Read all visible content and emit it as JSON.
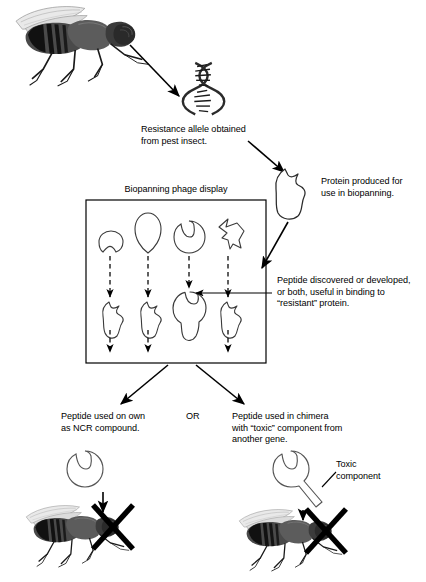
{
  "figure": {
    "title_visible": false,
    "type": "biological-process-flow-diagram",
    "ink_color": "#000000",
    "background": "#ffffff"
  },
  "labels": {
    "resistance_allele": "Resistance allele obtained\nfrom pest insect.",
    "protein_produced": "Protein produced for\nuse in biopanning.",
    "biopanning_box_title": "Biopanning phage display",
    "peptide_discovered": "Peptide discovered or developed,\nor both, useful in binding to\n“resistant” protein.",
    "peptide_on_own": "Peptide used on own\nas NCR compound.",
    "or_connector": "OR",
    "peptide_chimera": "Peptide used in chimera\nwith “toxic” component from\nanother gene.",
    "toxic_component": "Toxic\ncomponent"
  },
  "nodes": [
    {
      "id": "pest-insect-fly",
      "name": "pest insect (fly)",
      "stage": 1
    },
    {
      "id": "dna-double-helix",
      "name": "resistance allele DNA double helix",
      "stage": 2
    },
    {
      "id": "resistant-protein",
      "name": "resistant protein",
      "stage": 3
    },
    {
      "id": "phage-display-box",
      "name": "biopanning phage display panel",
      "stage": 4
    },
    {
      "id": "selected-peptide",
      "name": "selected binding peptide",
      "stage": 5
    },
    {
      "id": "ncr-compound-fly",
      "name": "killed fly via NCR compound",
      "stage": 6
    },
    {
      "id": "chimera-fly",
      "name": "killed fly via chimera compound",
      "stage": 6
    }
  ],
  "phage_display": {
    "columns": 4,
    "binding_success_column": 3,
    "top_row_peptides": [
      {
        "index": 1,
        "shape": "crescent-notched-disc"
      },
      {
        "index": 2,
        "shape": "teardrop-oval"
      },
      {
        "index": 3,
        "shape": "disc-with-wave-notch"
      },
      {
        "index": 4,
        "shape": "angular-arrow-polygon"
      }
    ],
    "bottom_row_complexes": [
      {
        "index": 1,
        "shape": "protein-with-peptide-unbound"
      },
      {
        "index": 2,
        "shape": "protein-with-peptide-unbound"
      },
      {
        "index": 3,
        "shape": "protein-with-peptide-bound"
      },
      {
        "index": 4,
        "shape": "protein-with-peptide-unbound"
      }
    ],
    "connector_style": "dashed-downward-arrow"
  },
  "icons": {
    "fly": "fly-icon",
    "dna": "dna-helix-icon",
    "protein": "protein-icon",
    "peptide": "peptide-icon",
    "chimera": "chimera-icon",
    "cross": "x-cross-icon",
    "arrow": "arrow-icon",
    "dashed_arrow": "dashed-arrow-icon"
  }
}
